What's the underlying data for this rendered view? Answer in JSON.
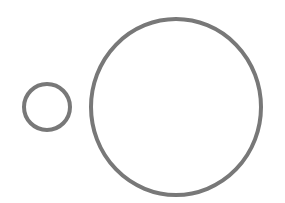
{
  "diagram": {
    "background": "#ffffff",
    "stroke_color": "#787878",
    "shapes": [
      {
        "name": "small-circle",
        "type": "circle",
        "cx": 47,
        "cy": 107,
        "rx": 23,
        "ry": 23,
        "stroke_width": 4
      },
      {
        "name": "large-circle",
        "type": "circle",
        "cx": 176,
        "cy": 107,
        "rx": 85,
        "ry": 88,
        "stroke_width": 4
      }
    ]
  }
}
